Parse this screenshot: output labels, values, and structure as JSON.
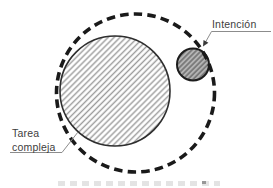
{
  "diagram": {
    "labels": {
      "intention": "Intención",
      "complex_task_line1": "Tarea",
      "complex_task_line2": "compleja"
    },
    "shapes": [
      {
        "name": "outer-dashed-circle",
        "type": "circle",
        "style": "dashed outline"
      },
      {
        "name": "complex-task-circle",
        "type": "circle",
        "style": "diagonal hatch on white",
        "label": "Tarea compleja"
      },
      {
        "name": "intention-circle",
        "type": "circle",
        "style": "diagonal hatch on gray",
        "label": "Intención"
      }
    ],
    "colors": {
      "background": "#ffffff",
      "dashed_circle_stroke": "#1a1a1a",
      "large_circle_border": "#2e2e2e",
      "large_circle_hatch": "#9b9b9b",
      "small_circle_fill": "#b3b3b3",
      "small_circle_hatch": "#6f6f6f",
      "small_circle_border": "#1c1c1c",
      "leader_line": "#8c8c8c",
      "arrowhead": "#3a3a3a",
      "label_text": "#3d3d3d"
    }
  }
}
